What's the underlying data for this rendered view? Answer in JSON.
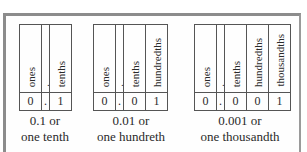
{
  "diagrams": [
    {
      "headers": [
        "ones",
        ".",
        "tenths"
      ],
      "digits": [
        "0",
        ".",
        "1"
      ],
      "caption_line1": "0.1 or",
      "caption_line2": "one tenth"
    },
    {
      "headers": [
        "ones",
        ".",
        "tenths",
        "hundredths"
      ],
      "digits": [
        "0",
        ".",
        "0",
        "1"
      ],
      "caption_line1": "0.01 or",
      "caption_line2": "one hundreth"
    },
    {
      "headers": [
        "ones",
        ".",
        "tenths",
        "hundredths",
        "thousandths"
      ],
      "digits": [
        "0",
        ".",
        "0",
        "0",
        "1"
      ],
      "caption_line1": "0.001 or",
      "caption_line2": "one thousandth"
    }
  ],
  "colors": {
    "frame_border": "#8c8c8c",
    "table_border": "#555555",
    "text": "#2a2a2a"
  }
}
